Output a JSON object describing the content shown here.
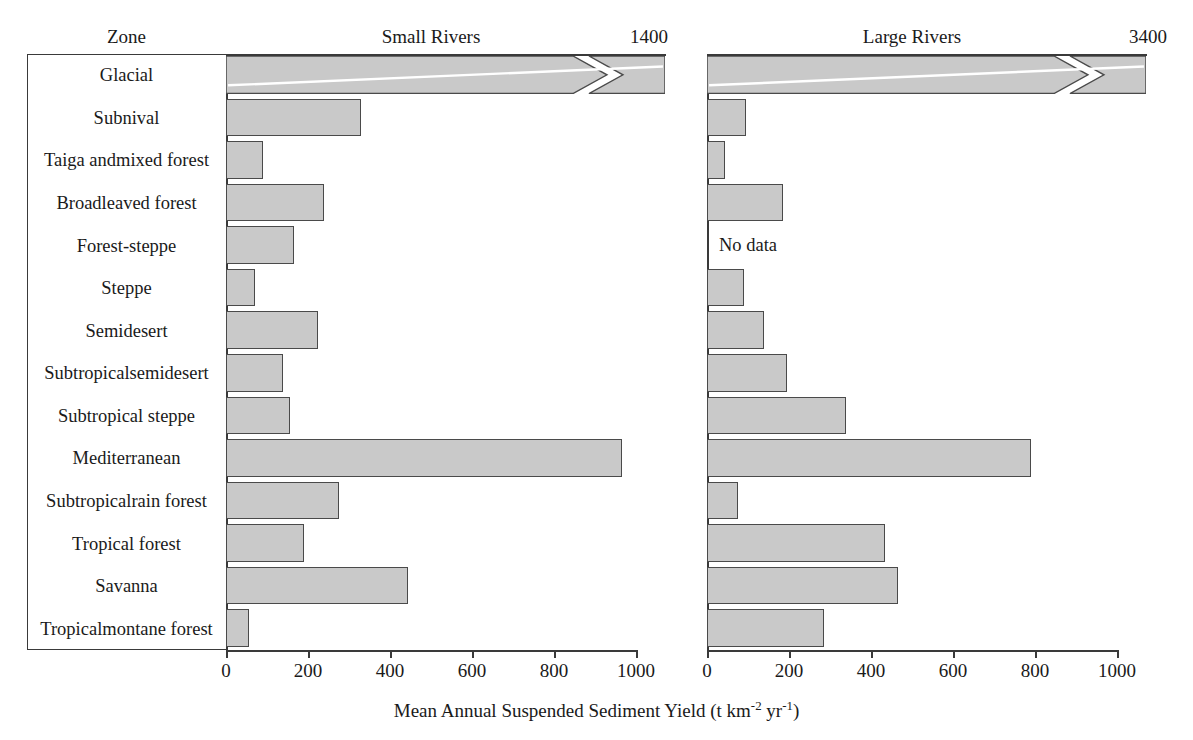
{
  "headers": {
    "zone": "Zone",
    "small_rivers": "Small Rivers",
    "large_rivers": "Large Rivers",
    "small_cap_value": "1400",
    "large_cap_value": "3400"
  },
  "axis": {
    "xlabel_main": "Mean Annual Suspended Sediment Yield (t km",
    "xlabel_sup1": "-2",
    "xlabel_mid": " yr",
    "xlabel_sup2": "-1",
    "xlabel_end": ")",
    "ticks": [
      "0",
      "200",
      "400",
      "600",
      "800",
      "1000"
    ],
    "tick_values": [
      0,
      200,
      400,
      600,
      800,
      1000
    ],
    "xmin": 0,
    "xmax": 1000,
    "no_data_label": "No data"
  },
  "colors": {
    "bar_fill": "#c9c9c9",
    "bar_stroke": "#4a4a4a",
    "frame": "#3a3a3a",
    "text": "#1a1a1a",
    "background": "#ffffff"
  },
  "chart_data": {
    "type": "bar",
    "orientation": "horizontal",
    "xlabel": "Mean Annual Suspended Sediment Yield (t km-2 yr-1)",
    "ylabel": "Zone",
    "xlim": [
      0,
      1000
    ],
    "grid": false,
    "legend": "none",
    "categories": [
      "Glacial",
      "Subnival",
      "Taiga and\nmixed forest",
      "Broadleaved forest",
      "Forest-steppe",
      "Steppe",
      "Semidesert",
      "Subtropical\nsemidesert",
      "Subtropical steppe",
      "Mediterranean",
      "Subtropical\nrain forest",
      "Tropical forest",
      "Savanna",
      "Tropical\nmontane forest"
    ],
    "categories_display": [
      [
        "Glacial"
      ],
      [
        "Subnival"
      ],
      [
        "Taiga and",
        "mixed forest"
      ],
      [
        "Broadleaved forest"
      ],
      [
        "Forest-steppe"
      ],
      [
        "Steppe"
      ],
      [
        "Semidesert"
      ],
      [
        "Subtropical",
        "semidesert"
      ],
      [
        "Subtropical steppe"
      ],
      [
        "Mediterranean"
      ],
      [
        "Subtropical",
        "rain forest"
      ],
      [
        "Tropical forest"
      ],
      [
        "Savanna"
      ],
      [
        "Tropical",
        "montane forest"
      ]
    ],
    "series": [
      {
        "name": "Small Rivers",
        "values": [
          1400,
          330,
          90,
          240,
          165,
          70,
          225,
          140,
          155,
          965,
          275,
          190,
          445,
          55
        ],
        "broken": [
          true,
          false,
          false,
          false,
          false,
          false,
          false,
          false,
          false,
          false,
          false,
          false,
          false,
          false
        ],
        "no_data": [
          false,
          false,
          false,
          false,
          false,
          false,
          false,
          false,
          false,
          false,
          false,
          false,
          false,
          false
        ]
      },
      {
        "name": "Large Rivers",
        "values": [
          3400,
          95,
          45,
          185,
          null,
          90,
          140,
          195,
          340,
          790,
          75,
          435,
          465,
          285
        ],
        "broken": [
          true,
          false,
          false,
          false,
          false,
          false,
          false,
          false,
          false,
          false,
          false,
          false,
          false,
          false
        ],
        "no_data": [
          false,
          false,
          false,
          false,
          true,
          false,
          false,
          false,
          false,
          false,
          false,
          false,
          false,
          false
        ]
      }
    ]
  }
}
